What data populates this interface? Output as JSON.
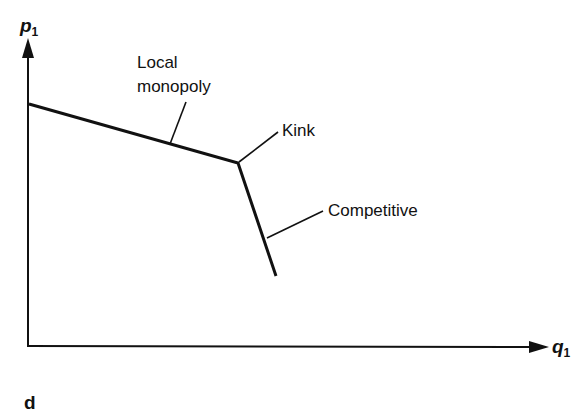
{
  "diagram": {
    "panel_label": "d",
    "axes": {
      "y_label": "p",
      "y_subscript": "1",
      "x_label": "q",
      "x_subscript": "1"
    },
    "curve": {
      "segments": [
        {
          "name": "Local monopoly",
          "from": [
            29,
            104
          ],
          "to": [
            238,
            163
          ]
        },
        {
          "name": "Competitive",
          "from": [
            238,
            163
          ],
          "to": [
            276,
            276
          ]
        }
      ]
    },
    "annotations": {
      "local_monopoly_line1": "Local",
      "local_monopoly_line2": "monopoly",
      "kink": "Kink",
      "competitive": "Competitive"
    },
    "colors": {
      "ink": "#111111",
      "background": "#ffffff"
    }
  }
}
